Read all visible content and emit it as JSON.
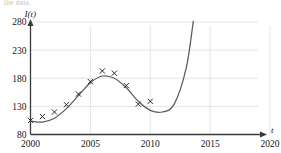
{
  "page": {
    "cropped_text_top": "the data."
  },
  "chart_data": {
    "type": "scatter",
    "title": "",
    "subtitle": "",
    "xlabel": "t",
    "ylabel": "I(t)",
    "xlim": [
      2000,
      2020
    ],
    "ylim": [
      80,
      280
    ],
    "xticks": [
      2000,
      2005,
      2010,
      2015,
      2020
    ],
    "yticks": [
      80,
      130,
      180,
      230,
      280
    ],
    "xtick_labels": [
      "2000",
      "2005",
      "2010",
      "2015",
      "2020"
    ],
    "ytick_labels": [
      "80",
      "130",
      "180",
      "230",
      "280"
    ],
    "grid": true,
    "legend": "none",
    "marker_style": "x",
    "series": [
      {
        "name": "observed data",
        "type": "scatter",
        "marker": "x",
        "x": [
          2000,
          2001,
          2002,
          2003,
          2004,
          2005,
          2006,
          2007,
          2008,
          2009,
          2010
        ],
        "y": [
          105,
          112,
          120,
          133,
          152,
          174,
          193,
          189,
          167,
          134,
          139
        ]
      },
      {
        "name": "fitted model curve",
        "type": "line",
        "x": [
          2000,
          2001,
          2002,
          2003,
          2004,
          2005,
          2006,
          2007,
          2008,
          2009,
          2010,
          2011,
          2012,
          2013,
          2013.6
        ],
        "y": [
          104,
          102,
          109,
          126,
          149,
          172,
          184,
          180,
          163,
          139,
          123,
          120,
          134,
          198,
          282
        ]
      }
    ],
    "annotations": []
  },
  "axes": {
    "y_axis_name": "I(t)",
    "x_axis_name": "t"
  },
  "colors": {
    "curve": "#5a5a5a",
    "marker": "#2b2b2b",
    "grid": "#d9d9d9",
    "axis": "#3a3a3a",
    "text": "#151515",
    "background": "#ffffff"
  }
}
